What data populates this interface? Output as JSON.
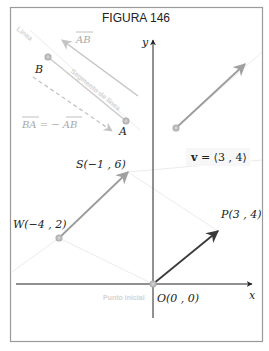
{
  "figure": {
    "title": "FIGURA  146",
    "axes": {
      "x_label": "x",
      "y_label": "y"
    },
    "labels": {
      "origin": "O(0 , 0)",
      "initial_point": "Punto inicial",
      "P": "P(3 , 4)",
      "S": "S(−1 , 6)",
      "W": "W(−4 , 2)",
      "A": "A",
      "B": "B",
      "AB": "AB",
      "BA_eq": "BA = − AB",
      "line": "Línea",
      "segment": "Segmento de línea",
      "vector_bold": "v",
      "vector_rest": " = ⟨3 , 4⟩"
    },
    "points": {
      "origin": [
        0,
        0
      ],
      "P": [
        3,
        4
      ],
      "S": [
        -1,
        6
      ],
      "W": [
        -4,
        2
      ]
    },
    "vector": [
      3,
      4
    ],
    "colors": {
      "frame": "#9a9a9a",
      "axis": "#222222",
      "main_vector": "#3a3a3a",
      "grey_vector": "#9c9c9c",
      "faint_line": "#ececec"
    }
  }
}
